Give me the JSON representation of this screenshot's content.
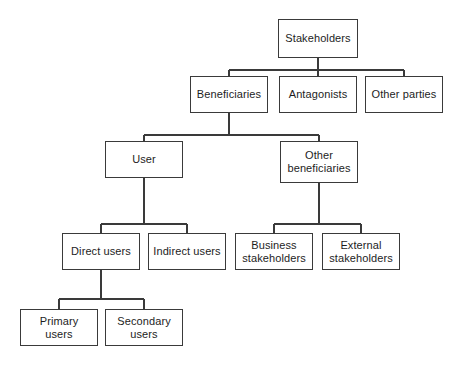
{
  "diagram": {
    "style": {
      "background": "#ffffff",
      "box_fill": "#ffffff",
      "box_border": "#3a3a3a",
      "line_color": "#3a3a3a",
      "text_color": "#1d1d1d"
    },
    "nodes": [
      {
        "id": "stakeholders",
        "label": "Stakeholders",
        "x": 278,
        "y": 19,
        "w": 80,
        "h": 39,
        "level": 1
      },
      {
        "id": "beneficiaries",
        "label": "Beneficiaries",
        "x": 190,
        "y": 76,
        "w": 78,
        "h": 37,
        "level": 2
      },
      {
        "id": "antagonists",
        "label": "Antagonists",
        "x": 279,
        "y": 76,
        "w": 78,
        "h": 37,
        "level": 2
      },
      {
        "id": "other-parties",
        "label": "Other parties",
        "x": 365,
        "y": 76,
        "w": 78,
        "h": 37,
        "level": 2
      },
      {
        "id": "user",
        "label": "User",
        "x": 105,
        "y": 141,
        "w": 78,
        "h": 37,
        "level": 3
      },
      {
        "id": "other-beneficiaries",
        "label": "Other\nbeneficiaries",
        "x": 280,
        "y": 141,
        "w": 78,
        "h": 42,
        "level": 3
      },
      {
        "id": "direct-users",
        "label": "Direct users",
        "x": 62,
        "y": 233,
        "w": 78,
        "h": 37,
        "level": 4
      },
      {
        "id": "indirect-users",
        "label": "Indirect users",
        "x": 148,
        "y": 233,
        "w": 78,
        "h": 37,
        "level": 4
      },
      {
        "id": "business-stakeholders",
        "label": "Business\nstakeholders",
        "x": 235,
        "y": 233,
        "w": 78,
        "h": 37,
        "level": 4
      },
      {
        "id": "external-stakeholders",
        "label": "External\nstakeholders",
        "x": 322,
        "y": 233,
        "w": 78,
        "h": 37,
        "level": 4
      },
      {
        "id": "primary-users",
        "label": "Primary\nusers",
        "x": 20,
        "y": 309,
        "w": 78,
        "h": 37,
        "level": 5
      },
      {
        "id": "secondary-users",
        "label": "Secondary\nusers",
        "x": 105,
        "y": 309,
        "w": 78,
        "h": 37,
        "level": 5
      }
    ],
    "edges": [
      {
        "from": "stakeholders",
        "to": [
          "beneficiaries",
          "antagonists",
          "other-parties"
        ],
        "bar_y": 70
      },
      {
        "from": "beneficiaries",
        "to": [
          "user",
          "other-beneficiaries"
        ],
        "bar_y": 135
      },
      {
        "from": "user",
        "to": [
          "direct-users",
          "indirect-users"
        ],
        "bar_y": 224
      },
      {
        "from": "other-beneficiaries",
        "to": [
          "business-stakeholders",
          "external-stakeholders"
        ],
        "bar_y": 224
      },
      {
        "from": "direct-users",
        "to": [
          "primary-users",
          "secondary-users"
        ],
        "bar_y": 299
      }
    ]
  }
}
